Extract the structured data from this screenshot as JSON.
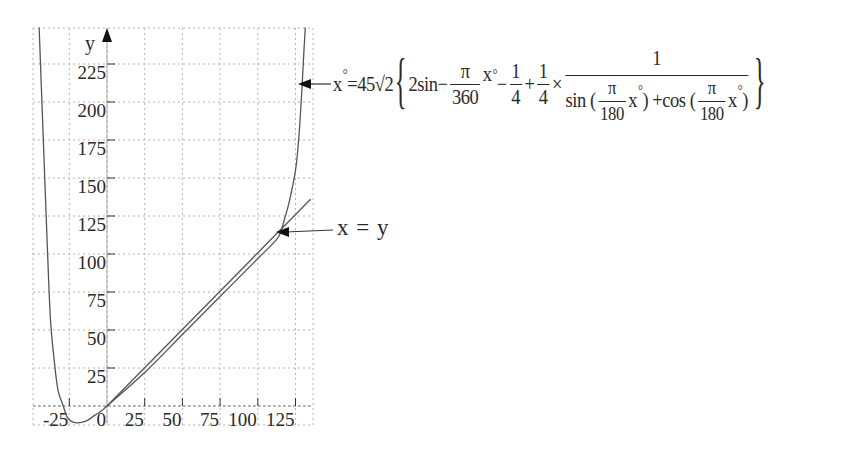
{
  "chart_data": {
    "type": "line",
    "title": "",
    "xlabel": "",
    "ylabel": "y",
    "xlim": [
      -49,
      137
    ],
    "ylim": [
      -12,
      249
    ],
    "grid": true,
    "grid_style": "dotted",
    "x_ticks": [
      -25,
      0,
      25,
      50,
      75,
      100,
      125
    ],
    "x_tick_labels": [
      "-25",
      "0",
      "25",
      "50",
      "75",
      "100",
      "125"
    ],
    "y_ticks": [
      25,
      50,
      75,
      100,
      125,
      150,
      175,
      200,
      225
    ],
    "y_tick_labels": [
      "25",
      "50",
      "75",
      "100",
      "125",
      "150",
      "175",
      "200",
      "225"
    ],
    "series": [
      {
        "name": "x° curve",
        "color": "#555555",
        "points": [
          [
            -45,
            249
          ],
          [
            -42,
            169
          ],
          [
            -39.5,
            103
          ],
          [
            -37.5,
            57
          ],
          [
            -35,
            30
          ],
          [
            -32.5,
            10.5
          ],
          [
            -29,
            0
          ],
          [
            -26,
            -8
          ],
          [
            -21,
            -11
          ],
          [
            -14,
            -10
          ],
          [
            -8,
            -6
          ],
          [
            -4,
            -3.5
          ],
          [
            0,
            0
          ],
          [
            25,
            22
          ],
          [
            50,
            47
          ],
          [
            75,
            72
          ],
          [
            100,
            97
          ],
          [
            112,
            109
          ],
          [
            115,
            114
          ],
          [
            118,
            124
          ],
          [
            121,
            135
          ],
          [
            125,
            155
          ],
          [
            127,
            174
          ],
          [
            129,
            204
          ],
          [
            130.5,
            232
          ],
          [
            131.5,
            249
          ]
        ]
      },
      {
        "name": "x = y",
        "color": "#555555",
        "points": [
          [
            0,
            0
          ],
          [
            135,
            136
          ]
        ]
      }
    ],
    "annotations": [
      {
        "text": "x = y",
        "arrow_to": [
          113,
          115
        ]
      },
      {
        "text": "x°=45√2{2sin−(π/360)x°−1/4+1/4×1/(sin(π/180 x°)+cos(π/180 x°))}",
        "arrow_to": [
          131,
          212
        ]
      }
    ]
  },
  "labels": {
    "y_axis": "y",
    "xy_annotation": "x = y",
    "formula": {
      "lhs": "x",
      "deg": "°",
      "eq": "=45√2",
      "open_brace": "{",
      "close_brace": "}",
      "two_sin": "2sin",
      "minus1": "−",
      "pi": "π",
      "den360": "360",
      "x_var": "x",
      "minus2": "−",
      "one": "1",
      "four": "4",
      "plus": "+",
      "times": "×",
      "sin_open": "sin (",
      "den180": "180",
      "close_paren": ")",
      "plus_cos": " +cos (",
      "numerator_one": "1"
    }
  }
}
